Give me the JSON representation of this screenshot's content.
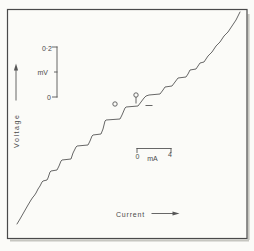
{
  "figure": {
    "colors": {
      "background": "#fbfbf8",
      "frame": "#4a4a4a",
      "line": "#565656",
      "text": "#4a4a4a",
      "shadow": "#c6c6c0"
    },
    "ylabel": "Voltage",
    "xlabel": "Current",
    "y_scalebar": {
      "top_label": "0·2",
      "unit_label": "mV",
      "zero_label": "0"
    },
    "x_scalebar": {
      "zero_label": "0",
      "unit_label": "mA",
      "right_label": "4"
    }
  },
  "chart_data": {
    "type": "line",
    "title": "",
    "xlabel": "Current",
    "ylabel": "Voltage",
    "grid": false,
    "legend": null,
    "x_axis": {
      "style": "scale-bar",
      "span_value": 4,
      "unit": "mA",
      "tick_labels": [
        "0",
        "4"
      ]
    },
    "y_axis": {
      "style": "scale-bar",
      "span_value": 0.2,
      "unit": "mV",
      "tick_labels": [
        "0",
        "0·2"
      ]
    },
    "curve_points_px": [
      [
        17,
        224
      ],
      [
        20,
        219
      ],
      [
        24,
        212
      ],
      [
        28,
        205
      ],
      [
        31,
        200
      ],
      [
        33,
        197
      ],
      [
        34,
        196
      ],
      [
        36,
        193
      ],
      [
        38,
        189
      ],
      [
        40,
        186
      ],
      [
        42,
        182
      ],
      [
        43,
        181
      ],
      [
        47,
        180
      ],
      [
        48,
        178
      ],
      [
        50,
        172
      ],
      [
        51,
        171
      ],
      [
        57,
        170
      ],
      [
        59,
        166
      ],
      [
        61,
        161
      ],
      [
        62,
        160
      ],
      [
        71,
        159
      ],
      [
        73,
        153
      ],
      [
        76,
        147
      ],
      [
        77,
        146
      ],
      [
        88,
        145
      ],
      [
        90,
        141
      ],
      [
        92,
        136
      ],
      [
        93,
        135
      ],
      [
        101,
        134
      ],
      [
        103,
        129
      ],
      [
        105,
        121
      ],
      [
        106,
        120
      ],
      [
        120,
        119
      ],
      [
        122,
        115
      ],
      [
        125,
        108
      ],
      [
        126,
        107
      ],
      [
        138,
        106
      ],
      [
        141,
        102
      ],
      [
        144,
        98
      ],
      [
        146,
        96
      ],
      [
        149,
        95
      ],
      [
        160,
        94
      ],
      [
        163,
        90
      ],
      [
        165,
        87
      ],
      [
        172,
        86
      ],
      [
        175,
        82
      ],
      [
        178,
        78
      ],
      [
        186,
        77
      ],
      [
        188,
        74
      ],
      [
        190,
        70
      ],
      [
        196,
        69
      ],
      [
        198,
        66
      ],
      [
        200,
        63
      ],
      [
        204,
        62
      ],
      [
        206,
        59
      ],
      [
        208,
        56
      ],
      [
        210,
        54
      ],
      [
        212,
        52
      ],
      [
        214,
        49
      ],
      [
        216,
        46
      ],
      [
        218,
        44
      ],
      [
        220,
        42
      ],
      [
        222,
        39
      ],
      [
        224,
        36
      ],
      [
        226,
        34
      ],
      [
        228,
        32
      ],
      [
        230,
        29
      ],
      [
        232,
        26
      ],
      [
        234,
        23
      ],
      [
        236,
        20
      ],
      [
        238,
        16
      ],
      [
        240,
        12
      ]
    ],
    "markers": {
      "circle_left": {
        "cx": 115,
        "cy": 104,
        "r": 2.2
      },
      "circle_top": {
        "cx": 136,
        "cy": 95,
        "r": 2.2
      },
      "tick": {
        "x1": 136,
        "y1": 97.5,
        "x2": 136,
        "y2": 103
      },
      "dash": {
        "x1": 146,
        "y1": 105.5,
        "x2": 152,
        "y2": 105.5
      }
    }
  }
}
